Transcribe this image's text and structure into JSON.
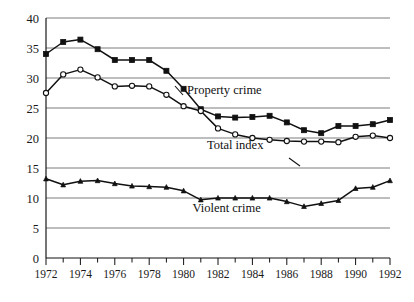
{
  "chart_data": {
    "type": "line",
    "title": "",
    "subtitle": "",
    "xlabel": "",
    "ylabel": "",
    "xlim": [
      1972,
      1992
    ],
    "ylim": [
      0,
      40
    ],
    "grid": true,
    "legend_position": "inline-annotations",
    "x": [
      1972,
      1973,
      1974,
      1975,
      1976,
      1977,
      1978,
      1979,
      1980,
      1981,
      1982,
      1983,
      1984,
      1985,
      1986,
      1987,
      1988,
      1989,
      1990,
      1991,
      1992
    ],
    "y_ticks": [
      0,
      5,
      10,
      15,
      20,
      25,
      30,
      35,
      40
    ],
    "y_tick_labels": [
      "0",
      "5",
      "10",
      "15",
      "20",
      "25",
      "30",
      "35",
      "40"
    ],
    "x_ticks": [
      1972,
      1973,
      1974,
      1975,
      1976,
      1977,
      1978,
      1979,
      1980,
      1981,
      1982,
      1983,
      1984,
      1985,
      1986,
      1987,
      1988,
      1989,
      1990,
      1991,
      1992
    ],
    "x_tick_labels_shown": [
      "1972",
      "1974",
      "1976",
      "1978",
      "1980",
      "1982",
      "1984",
      "1986",
      "1988",
      "1990",
      "1992"
    ],
    "x_tick_labels_shown_values": [
      1972,
      1974,
      1976,
      1978,
      1980,
      1982,
      1984,
      1986,
      1988,
      1990,
      1992
    ],
    "series": [
      {
        "name": "Property crime",
        "marker": "filled-square",
        "values": [
          34.0,
          36.0,
          36.4,
          34.8,
          33.0,
          33.0,
          33.0,
          31.2,
          28.2,
          24.8,
          23.6,
          23.4,
          23.5,
          23.7,
          22.6,
          21.3,
          20.8,
          22.0,
          22.0,
          22.3,
          23.0
        ]
      },
      {
        "name": "Total index",
        "marker": "open-circle",
        "values": [
          27.5,
          30.6,
          31.4,
          30.1,
          28.6,
          28.7,
          28.6,
          27.2,
          25.3,
          24.5,
          21.6,
          20.6,
          20.0,
          19.7,
          19.5,
          19.4,
          19.4,
          19.3,
          20.2,
          20.4,
          20.0
        ]
      },
      {
        "name": "Violent crime",
        "marker": "small-triangle",
        "values": [
          13.2,
          12.2,
          12.8,
          12.9,
          12.4,
          12.0,
          11.9,
          11.8,
          11.2,
          9.7,
          10.0,
          10.0,
          10.0,
          10.0,
          9.4,
          8.6,
          9.1,
          9.6,
          11.6,
          11.8,
          12.9
        ]
      }
    ],
    "annotations": [
      {
        "text": "Property crime",
        "x": 1980.2,
        "y": 27.3
      },
      {
        "text": "Total index",
        "x": 1983.0,
        "y": 18.2
      },
      {
        "text": "Violent crime",
        "x": 1982.5,
        "y": 7.6
      }
    ]
  }
}
